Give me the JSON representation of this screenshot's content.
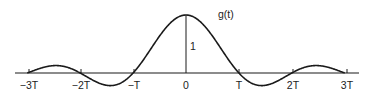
{
  "diagram": {
    "function_label": "g(t)",
    "amplitude_label": "1",
    "function": "sinc(t/T)",
    "ticks": [
      {
        "label": "−3T",
        "x": 29
      },
      {
        "label": "−2T",
        "x": 81
      },
      {
        "label": "−T",
        "x": 134
      },
      {
        "label": "0",
        "x": 186
      },
      {
        "label": "T",
        "x": 239
      },
      {
        "label": "2T",
        "x": 293
      },
      {
        "label": "3T",
        "x": 347
      }
    ],
    "colors": {
      "stroke": "#1a1a1a",
      "background": "#ffffff"
    }
  }
}
